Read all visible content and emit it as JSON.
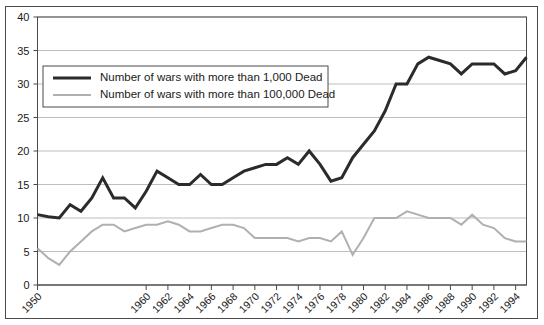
{
  "chart_data": {
    "type": "line",
    "title": "",
    "xlabel": "",
    "ylabel": "",
    "xlim": [
      1950,
      1995
    ],
    "ylim": [
      0,
      40
    ],
    "ytick_values": [
      0,
      5,
      10,
      15,
      20,
      25,
      30,
      35,
      40
    ],
    "ytick_labels": [
      "0",
      "5",
      "10",
      "15",
      "20",
      "25",
      "30",
      "35",
      "40"
    ],
    "xtick_values": [
      1950,
      1960,
      1962,
      1964,
      1966,
      1968,
      1970,
      1972,
      1974,
      1976,
      1978,
      1980,
      1982,
      1984,
      1986,
      1988,
      1990,
      1992,
      1994
    ],
    "xtick_labels": [
      "1950",
      "1960",
      "1962",
      "1964",
      "1966",
      "1968",
      "1970",
      "1972",
      "1974",
      "1976",
      "1978",
      "1980",
      "1982",
      "1984",
      "1986",
      "1988",
      "1990",
      "1992",
      "1994"
    ],
    "grid": true,
    "grid_axis": "y",
    "legend_position": "upper-left-inside",
    "x": [
      1950,
      1951,
      1952,
      1953,
      1954,
      1955,
      1956,
      1957,
      1958,
      1959,
      1960,
      1961,
      1962,
      1963,
      1964,
      1965,
      1966,
      1967,
      1968,
      1969,
      1970,
      1971,
      1972,
      1973,
      1974,
      1975,
      1976,
      1977,
      1978,
      1979,
      1980,
      1981,
      1982,
      1983,
      1984,
      1985,
      1986,
      1987,
      1988,
      1989,
      1990,
      1991,
      1992,
      1993,
      1994,
      1995
    ],
    "series": [
      {
        "name": "Number of wars with more than 1,000 Dead",
        "color": "#2b2b2b",
        "width": 3,
        "values": [
          10.5,
          10.2,
          10.0,
          12.0,
          11.0,
          13.0,
          16.0,
          13.0,
          13.0,
          11.5,
          14.0,
          17.0,
          16.0,
          15.0,
          15.0,
          16.5,
          15.0,
          15.0,
          16.0,
          17.0,
          17.5,
          18.0,
          18.0,
          19.0,
          18.0,
          20.0,
          18.0,
          15.5,
          16.0,
          19.0,
          21.0,
          23.0,
          26.0,
          30.0,
          30.0,
          33.0,
          34.0,
          33.5,
          33.0,
          31.5,
          33.0,
          33.0,
          33.0,
          31.5,
          32.0,
          34.0
        ]
      },
      {
        "name": "Number of wars with more than 100,000 Dead",
        "color": "#b0b0b0",
        "width": 2,
        "values": [
          5.5,
          4.0,
          3.0,
          5.0,
          6.5,
          8.0,
          9.0,
          9.0,
          8.0,
          8.5,
          9.0,
          9.0,
          9.5,
          9.0,
          8.0,
          8.0,
          8.5,
          9.0,
          9.0,
          8.5,
          7.0,
          7.0,
          7.0,
          7.0,
          6.5,
          7.0,
          7.0,
          6.5,
          8.0,
          4.5,
          7.0,
          10.0,
          10.0,
          10.0,
          11.0,
          10.5,
          10.0,
          10.0,
          10.0,
          9.0,
          10.5,
          9.0,
          8.5,
          7.0,
          6.5,
          6.5
        ]
      }
    ]
  },
  "legend": {
    "items": [
      {
        "label": "Number of wars with more than 1,000 Dead",
        "color": "#2b2b2b"
      },
      {
        "label": "Number of wars with more than 100,000 Dead",
        "color": "#b0b0b0"
      }
    ]
  }
}
